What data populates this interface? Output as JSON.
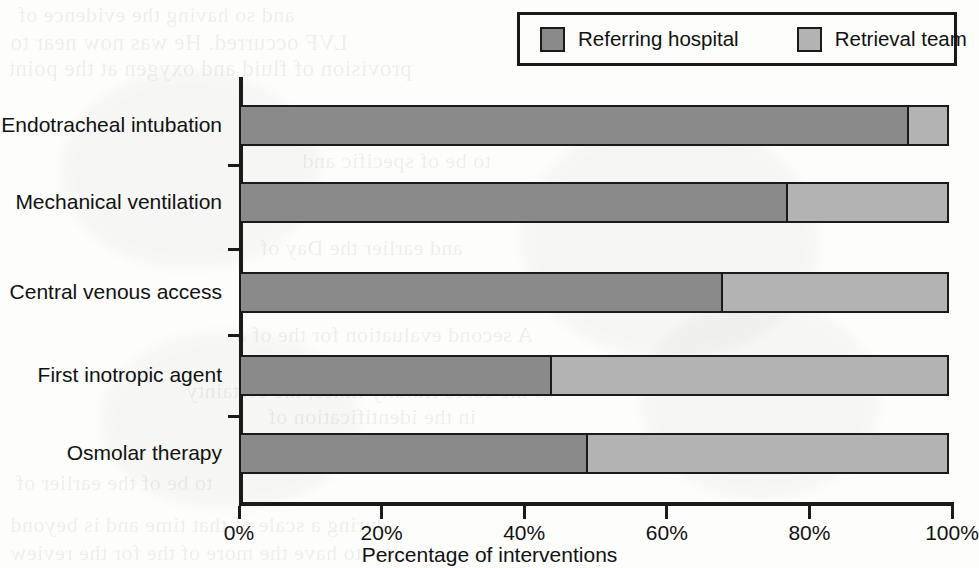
{
  "chart_data": {
    "type": "bar",
    "orientation": "horizontal",
    "stacked": true,
    "stack_mode": "percent",
    "title": "",
    "subtitle": "",
    "xlabel": "Percentage of interventions",
    "ylabel": "",
    "xlim": [
      0,
      100
    ],
    "xtick_labels": [
      "0%",
      "20%",
      "40%",
      "60%",
      "80%",
      "100%"
    ],
    "xtick_values": [
      0,
      20,
      40,
      60,
      80,
      100
    ],
    "grid": false,
    "legend_position": "top-right",
    "categories": [
      "Endotracheal intubation",
      "Mechanical ventilation",
      "Central venous access",
      "First inotropic agent",
      "Osmolar therapy"
    ],
    "series": [
      {
        "name": "Referring hospital",
        "color": "#8a8a8a",
        "values": [
          94,
          77,
          68,
          44,
          49
        ]
      },
      {
        "name": "Retrieval team",
        "color": "#b3b3b3",
        "values": [
          6,
          23,
          32,
          56,
          51
        ]
      }
    ]
  },
  "legend": {
    "entries": [
      {
        "label": "Referring hospital",
        "color": "#8a8a8a"
      },
      {
        "label": "Retrieval team",
        "color": "#b3b3b3"
      }
    ]
  },
  "axes": {
    "x_title": "Percentage of interventions",
    "x_ticks": [
      "0%",
      "20%",
      "40%",
      "60%",
      "80%",
      "100%"
    ],
    "y_ticks": [
      "Endotracheal intubation",
      "Mechanical ventilation",
      "Central venous access",
      "First inotropic agent",
      "Osmolar therapy"
    ]
  },
  "scan_artifacts": {
    "ghost_lines": [
      {
        "text": "and so having the evidence of",
        "x": 18,
        "y": 2,
        "size": 22
      },
      {
        "text": "LVF occurred. He was now near to",
        "x": 10,
        "y": 30,
        "size": 23
      },
      {
        "text": "provision of fluid and oxygen at the point",
        "x": 8,
        "y": 56,
        "size": 23
      },
      {
        "text": "to be of specific and",
        "x": 302,
        "y": 148,
        "size": 22
      },
      {
        "text": "and earlier the Day of",
        "x": 260,
        "y": 235,
        "size": 22
      },
      {
        "text": "contributing to the patient",
        "x": 252,
        "y": 288,
        "size": 22
      },
      {
        "text": "A second evaluation for the of a",
        "x": 236,
        "y": 322,
        "size": 22
      },
      {
        "text": "as the cases fluidity times, the certainty",
        "x": 186,
        "y": 378,
        "size": 22
      },
      {
        "text": "in the identification of",
        "x": 268,
        "y": 404,
        "size": 22
      },
      {
        "text": "to be of the earlier of",
        "x": 16,
        "y": 470,
        "size": 22
      },
      {
        "text": "during a scale of that time and is beyond",
        "x": 10,
        "y": 512,
        "size": 22
      },
      {
        "text": "to have the more of the for the review",
        "x": 10,
        "y": 540,
        "size": 22
      }
    ]
  }
}
